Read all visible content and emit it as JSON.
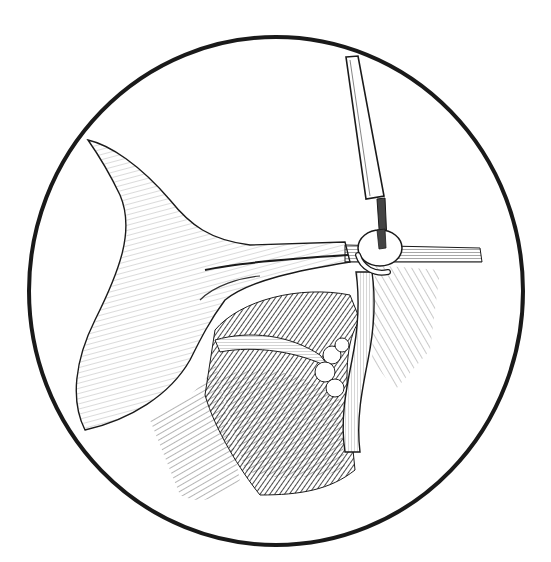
{
  "illustration": {
    "subject": "surgical-illustration",
    "style": "pen-and-ink",
    "frame": "circle",
    "colors": {
      "ink": "#1a1a1a",
      "paper": "#ffffff",
      "mid": "#555555",
      "light": "#9a9a9a"
    },
    "elements": [
      {
        "name": "circular-frame"
      },
      {
        "name": "surgical-instrument-shaft"
      },
      {
        "name": "instrument-tip"
      },
      {
        "name": "clip-ring"
      },
      {
        "name": "tissue-flap"
      },
      {
        "name": "horizontal-vessel"
      },
      {
        "name": "vertical-vessel"
      },
      {
        "name": "dark-cavity"
      },
      {
        "name": "nodular-tissue"
      }
    ]
  }
}
